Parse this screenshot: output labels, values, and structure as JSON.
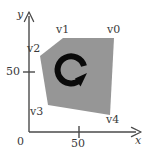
{
  "figure": {
    "title": "polygon-rotation-diagram",
    "background_color": "#ffffff",
    "polygon_fill": "#969696",
    "axis_color": "#4a4a4a",
    "text_color": "#3a3a3a",
    "arrow_color": "#0a0a0a"
  },
  "axes": {
    "x_label": "x",
    "y_label": "y",
    "origin_label": "0",
    "x_ticks": [
      {
        "label": "50",
        "value": 50
      }
    ],
    "y_ticks": [
      {
        "label": "50",
        "value": 50
      }
    ],
    "x_axis_name": "x-axis",
    "y_axis_name": "y-axis"
  },
  "polygon": {
    "name": "gray-pentagon",
    "vertex_labels": [
      "v0",
      "v1",
      "v2",
      "v3",
      "v4"
    ],
    "vertices": [
      {
        "label": "v0",
        "x": 88,
        "y": 88
      },
      {
        "label": "v1",
        "x": 37,
        "y": 88
      },
      {
        "label": "v2",
        "x": 13,
        "y": 68
      },
      {
        "label": "v3",
        "x": 21,
        "y": 22
      },
      {
        "label": "v4",
        "x": 83,
        "y": 12
      }
    ]
  },
  "rotation_arrow": {
    "name": "clockwise-rotation-arrow",
    "direction": "clockwise",
    "center_x": 54,
    "center_y": 52
  }
}
